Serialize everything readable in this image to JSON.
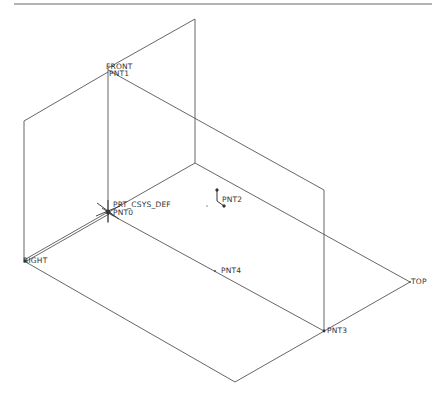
{
  "viewport": {
    "width": 447,
    "height": 405,
    "background": "#ffffff"
  },
  "colors": {
    "line": "#555555",
    "label": "#333333",
    "border": "#666666"
  },
  "datum_planes": [
    {
      "name": "FRONT",
      "label": "FRONT"
    },
    {
      "name": "RIGHT",
      "label": "RIGHT"
    },
    {
      "name": "TOP",
      "label": "TOP"
    }
  ],
  "coordinate_system": {
    "label": "PRT_CSYS_DEF"
  },
  "datum_points": [
    {
      "name": "PNT0",
      "label": "PNT0"
    },
    {
      "name": "PNT1",
      "label": "PNT1"
    },
    {
      "name": "PNT2",
      "label": "PNT2"
    },
    {
      "name": "PNT3",
      "label": "PNT3"
    },
    {
      "name": "PNT4",
      "label": "PNT4"
    }
  ],
  "labels": {
    "front": "FRONT",
    "right": "RIGHT",
    "top": "TOP",
    "csys": "PRT_CSYS_DEF",
    "pnt0": "PNT0",
    "pnt1": "PNT1",
    "pnt2": "PNT2",
    "pnt3": "PNT3",
    "pnt4": "PNT4"
  }
}
